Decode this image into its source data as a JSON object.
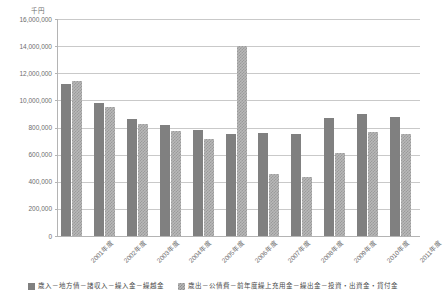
{
  "top_strip_text": "",
  "unit_label": "千円",
  "chart_data": {
    "type": "bar",
    "title": "",
    "subtitle": "",
    "xlabel": "",
    "ylabel": "千円",
    "grid": true,
    "legend_position": "bottom",
    "ylim": [
      0,
      16000000
    ],
    "ytick_labels": [
      "16,000,000",
      "14,000,000",
      "12,000,000",
      "10,000,000",
      "800,000",
      "600,000",
      "400,000",
      "200,000",
      "0"
    ],
    "ytick_values": [
      16000000,
      14000000,
      12000000,
      10000000,
      8000000,
      6000000,
      4000000,
      2000000,
      0
    ],
    "categories": [
      "2001年度",
      "2002年度",
      "2003年度",
      "2004年度",
      "2005年度",
      "2006年度",
      "2007年度",
      "2008年度",
      "2009年度",
      "2010年度",
      "2011年度"
    ],
    "series": [
      {
        "name": "歳入－地方債－諸収入－繰入金－繰越金",
        "color": "#808080",
        "values": [
          11200000,
          9800000,
          8650000,
          8200000,
          7850000,
          7500000,
          7600000,
          7550000,
          8700000,
          9000000,
          8800000
        ]
      },
      {
        "name": "歳出－公債費－前年度繰上充用金－繰出金－投資・出資金・貸付金",
        "color": "#b8b8b8",
        "values": [
          11400000,
          9500000,
          8250000,
          7750000,
          7150000,
          14000000,
          4550000,
          4350000,
          6100000,
          7700000,
          7550000
        ]
      }
    ]
  },
  "legend": {
    "items": [
      {
        "label": "歳入－地方債－諸収入－繰入金－繰越金"
      },
      {
        "label": "歳出－公債費－前年度繰上充用金－繰出金－投資・出資金・貸付金"
      }
    ]
  }
}
